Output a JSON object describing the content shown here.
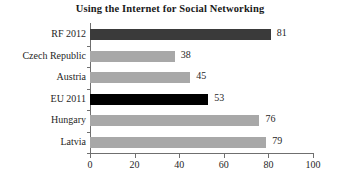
{
  "chart_data": {
    "type": "bar",
    "orientation": "horizontal",
    "title": "Using the Internet for Social Networking",
    "xlabel": "",
    "ylabel": "",
    "xlim": [
      0,
      100
    ],
    "xticks": [
      0,
      20,
      40,
      60,
      80,
      100
    ],
    "xtick_labels": [
      "0",
      "20",
      "40",
      "60",
      "80",
      "100"
    ],
    "grid": false,
    "legend": null,
    "categories": [
      "RF 2012",
      "Czech Republic",
      "Austria",
      "EU 2011",
      "Hungary",
      "Latvia"
    ],
    "values": [
      81,
      38,
      45,
      53,
      76,
      79
    ],
    "value_labels": [
      "81",
      "38",
      "45",
      "53",
      "76",
      "79"
    ],
    "bar_colors": [
      "#3a3a3a",
      "#a8a8a8",
      "#a8a8a8",
      "#000000",
      "#a8a8a8",
      "#a8a8a8"
    ],
    "bars": [
      {
        "category": "RF 2012",
        "value": 81,
        "label": "81",
        "color": "#3a3a3a"
      },
      {
        "category": "Czech Republic",
        "value": 38,
        "label": "38",
        "color": "#a8a8a8"
      },
      {
        "category": "Austria",
        "value": 45,
        "label": "45",
        "color": "#a8a8a8"
      },
      {
        "category": "EU 2011",
        "value": 53,
        "label": "53",
        "color": "#000000"
      },
      {
        "category": "Hungary",
        "value": 76,
        "label": "76",
        "color": "#a8a8a8"
      },
      {
        "category": "Latvia",
        "value": 79,
        "label": "79",
        "color": "#a8a8a8"
      }
    ]
  },
  "style": {
    "axis_color": "#6f6f6f",
    "text_color": "#1f1f1f",
    "background": "#ffffff",
    "highlight_dark": "#3a3a3a",
    "highlight_black": "#000000",
    "bar_gray": "#a8a8a8"
  }
}
